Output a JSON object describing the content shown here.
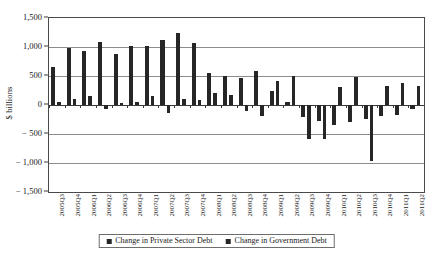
{
  "chart_data": {
    "type": "bar",
    "title": "",
    "xlabel": "",
    "ylabel": "$ billions",
    "ylim": [
      -1500,
      1500
    ],
    "ytick_values": [
      1500,
      1000,
      500,
      0,
      -500,
      -1000,
      -1500
    ],
    "ytick_labels": [
      "1,500",
      "1,000",
      "500",
      "0",
      "− 500",
      "− 1,000",
      "− 1,500"
    ],
    "grid": true,
    "legend_position": "bottom-center",
    "categories": [
      "2005Q3",
      "2005Q4",
      "2006Q1",
      "2006Q2",
      "2006Q3",
      "2006Q4",
      "2007Q1",
      "2007Q2",
      "2007Q3",
      "2007Q4",
      "2008Q1",
      "2008Q2",
      "2008Q3",
      "2008Q4",
      "2009Q1",
      "2009Q2",
      "2009Q3",
      "2009Q4",
      "2010Q1",
      "2010Q2",
      "2010Q3",
      "2010Q4",
      "2011Q1",
      "2011Q2"
    ],
    "series": [
      {
        "name": "Change in Private Sector Debt",
        "color": "#262626",
        "values": [
          650,
          990,
          930,
          1080,
          880,
          1015,
          1020,
          1120,
          1240,
          1070,
          545,
          505,
          470,
          580,
          250,
          55,
          -210,
          -270,
          -340,
          -285,
          -235,
          -190,
          -180,
          -75
        ]
      },
      {
        "name": "Change in Government Debt",
        "color": "#262626",
        "values": [
          60,
          110,
          150,
          -65,
          35,
          50,
          150,
          -130,
          105,
          90,
          200,
          165,
          -100,
          -195,
          420,
          505,
          -590,
          -580,
          310,
          490,
          -965,
          335,
          375,
          330
        ]
      }
    ]
  },
  "legend": {
    "items": [
      {
        "label": "Change in Private Sector Debt"
      },
      {
        "label": "Change in Government Debt"
      }
    ]
  },
  "colors": {
    "bar": "#262626",
    "gridline": "#8c8c8c",
    "axis": "#3a3a3a",
    "background": "#ffffff"
  }
}
